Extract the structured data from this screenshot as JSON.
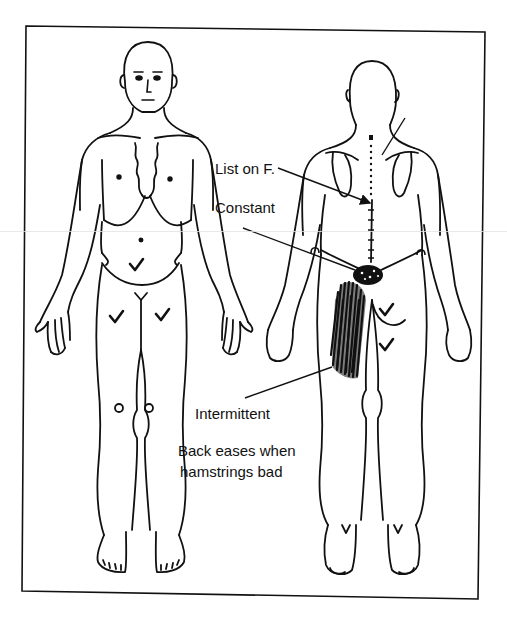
{
  "figure": {
    "colors": {
      "ink": "#111111",
      "background": "#ffffff",
      "scan_artifact": "#e2e2e2"
    },
    "views": [
      {
        "id": "front",
        "label": "Anterior view"
      },
      {
        "id": "back",
        "label": "Posterior view"
      }
    ],
    "annotations": [
      {
        "id": "list",
        "text": "List on F.",
        "x": 215,
        "y": 167
      },
      {
        "id": "constant",
        "text": "Constant",
        "x": 215,
        "y": 206
      },
      {
        "id": "intermittent",
        "text": "Intermittent",
        "x": 195,
        "y": 404
      },
      {
        "id": "note1",
        "text": "Back eases when",
        "x": 178,
        "y": 441
      },
      {
        "id": "note2",
        "text": "hamstrings bad",
        "x": 180,
        "y": 462
      }
    ],
    "markers": {
      "check_marks": [
        {
          "view": "front",
          "region": "lower-abdomen",
          "x": 136,
          "y": 267
        },
        {
          "view": "front",
          "region": "right-thigh",
          "x": 116,
          "y": 319
        },
        {
          "view": "front",
          "region": "left-thigh",
          "x": 163,
          "y": 317
        },
        {
          "view": "back",
          "region": "right-buttock",
          "x": 385,
          "y": 313
        },
        {
          "view": "back",
          "region": "right-posterior-thigh",
          "x": 385,
          "y": 347
        }
      ],
      "circles": [
        {
          "view": "front",
          "region": "right-knee",
          "x": 119,
          "y": 408
        },
        {
          "view": "front",
          "region": "left-knee",
          "x": 149,
          "y": 408
        }
      ],
      "small_arcs": [
        {
          "view": "back",
          "region": "left-elbow",
          "x": 315,
          "y": 250
        },
        {
          "view": "back",
          "region": "right-elbow",
          "x": 421,
          "y": 253
        }
      ]
    }
  }
}
